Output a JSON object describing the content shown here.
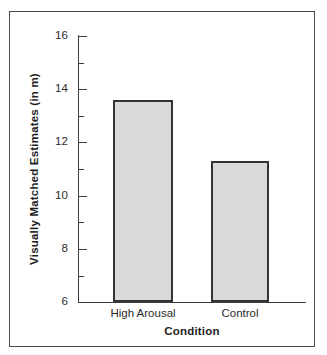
{
  "figure": {
    "background_color": "#ffffff",
    "frame_color": "#4a4a4a",
    "axis_color": "#3b3b3b"
  },
  "chart_data": {
    "type": "bar",
    "title": "",
    "categories": [
      "High Arousal",
      "Control"
    ],
    "values": [
      13.6,
      11.3
    ],
    "xlabel": "Condition",
    "ylabel": "Visually Matched Estimates (in m)",
    "ylim": [
      6,
      16
    ],
    "ytick_labels": [
      "16",
      "14",
      "12",
      "10",
      "8",
      "6"
    ],
    "ytick_values": [
      16,
      14,
      12,
      10,
      8,
      6
    ],
    "yminor_tick_values": [
      15,
      13,
      11,
      9,
      7
    ],
    "grid": false,
    "legend": false,
    "bar_fill_color": "#d9d9d9",
    "bar_edge_color": "#333333"
  }
}
